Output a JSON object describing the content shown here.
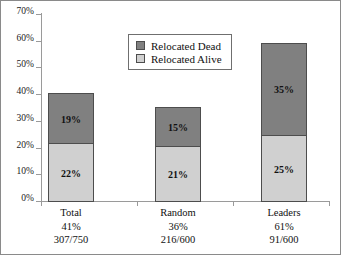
{
  "chart_data": {
    "type": "bar",
    "subtype": "stacked-bar",
    "title": "",
    "xlabel": "",
    "ylabel": "",
    "ylim": [
      0,
      70
    ],
    "ytick_step": 10,
    "ytick_labels": [
      "0%",
      "10%",
      "20%",
      "30%",
      "40%",
      "50%",
      "60%",
      "70%"
    ],
    "ytick_values": [
      0,
      10,
      20,
      30,
      40,
      50,
      60,
      70
    ],
    "grid": false,
    "legend_position": "upper-center-inside",
    "categories": [
      "Total",
      "Random",
      "Leaders"
    ],
    "series": [
      {
        "name": "Relocated Alive",
        "color": "#d0d0d0",
        "values": [
          22,
          21,
          25
        ],
        "labels": [
          "22%",
          "21%",
          "25%"
        ]
      },
      {
        "name": "Relocated Dead",
        "color": "#808080",
        "values": [
          19,
          15,
          35
        ],
        "labels": [
          "19%",
          "15%",
          "35%"
        ]
      }
    ],
    "totals": [
      41,
      36,
      60
    ],
    "category_annotations": [
      {
        "name": "Total",
        "percent": "41%",
        "fraction": "307/750"
      },
      {
        "name": "Random",
        "percent": "36%",
        "fraction": "216/600"
      },
      {
        "name": "Leaders",
        "percent": "61%",
        "fraction": "91/600"
      }
    ]
  },
  "legend": {
    "items": [
      {
        "label": "Relocated Dead",
        "color": "#808080"
      },
      {
        "label": "Relocated Alive",
        "color": "#d0d0d0"
      }
    ]
  },
  "colors": {
    "dead": "#808080",
    "alive": "#d0d0d0",
    "axis": "#9a9a9a",
    "segment_border": "#4d4d4d",
    "text": "#111111",
    "frame": "#8a8a8a"
  }
}
